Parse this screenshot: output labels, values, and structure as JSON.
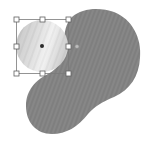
{
  "canvas": {
    "background": "#ffffff"
  },
  "shapes": [
    {
      "id": "blob",
      "kind": "path",
      "fill": "#858585",
      "texture": "diagonal-stripes",
      "selected": false
    },
    {
      "id": "circle",
      "kind": "ellipse",
      "fill_gradient": [
        "#c4c4c4",
        "#dedede",
        "#f2f2f2",
        "#d2d2d2"
      ],
      "texture": "diagonal-stripes",
      "selected": true
    }
  ],
  "selection": {
    "target": "circle",
    "box_color": "#707070",
    "handle_fill": "#ffffff",
    "handle_stroke": "#606060",
    "handles": [
      "top-left",
      "top-center",
      "top-right",
      "middle-left",
      "middle-right",
      "bottom-left",
      "bottom-center",
      "bottom-right"
    ],
    "center_marker": "center-point",
    "extra_handle": "rotation-handle"
  }
}
